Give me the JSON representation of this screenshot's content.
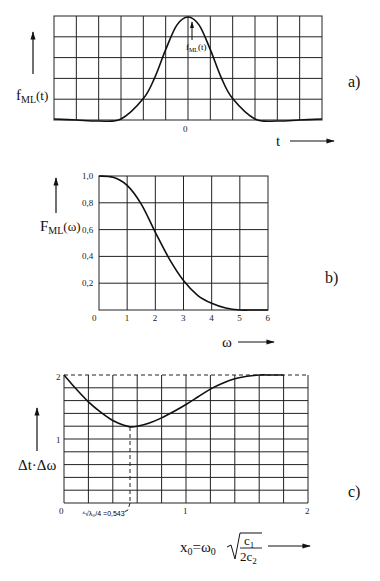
{
  "chart_data": [
    {
      "panel": "a)",
      "type": "line",
      "title": "",
      "ylabel": "f_ML(t)",
      "xlabel": "t",
      "annotation": "f_ML(t)",
      "x_tick_labels": [
        "0"
      ],
      "grid": {
        "columns": 12,
        "rows": 5
      },
      "x": [
        -6,
        -5,
        -4,
        -3,
        -2,
        -1.5,
        -1,
        -0.5,
        0,
        0.5,
        1,
        1.5,
        2,
        3,
        4,
        5,
        6
      ],
      "values": [
        0.0,
        -0.01,
        -0.02,
        0.0,
        0.2,
        0.4,
        0.68,
        0.92,
        1.0,
        0.92,
        0.68,
        0.4,
        0.2,
        0.0,
        -0.02,
        -0.01,
        0.0
      ],
      "ylim": [
        0,
        1
      ],
      "xlim": [
        -6,
        6
      ]
    },
    {
      "panel": "b)",
      "type": "line",
      "title": "",
      "ylabel": "F_ML(ω)",
      "xlabel": "ω",
      "x_tick_labels": [
        "0",
        "1",
        "2",
        "3",
        "4",
        "5",
        "6"
      ],
      "y_tick_labels": [
        "0,2",
        "0,4",
        "0,6",
        "0,8",
        "1,0"
      ],
      "x": [
        0,
        0.5,
        1,
        1.5,
        2,
        2.5,
        3,
        3.5,
        4,
        4.5,
        5,
        5.5,
        6
      ],
      "values": [
        1.0,
        0.99,
        0.93,
        0.79,
        0.58,
        0.38,
        0.22,
        0.11,
        0.05,
        0.015,
        0.0,
        0.0,
        0.0
      ],
      "xlim": [
        0,
        6
      ],
      "ylim": [
        0,
        1.0
      ],
      "grid": {
        "columns": 6,
        "rows": 5
      }
    },
    {
      "panel": "c)",
      "type": "line",
      "title": "",
      "ylabel": "Δt·Δω",
      "xlabel": "x₀ = ω₀ √(c₁ / 2c₂)",
      "x_tick_labels": [
        "0",
        "1",
        "2"
      ],
      "y_tick_labels": [
        "1",
        "2"
      ],
      "annotation": "⁴√(λ₀/4) = 0,543",
      "min_point": {
        "x": 0.543,
        "y": 1.19
      },
      "asymptote": 2,
      "x": [
        0,
        0.1,
        0.2,
        0.3,
        0.4,
        0.5,
        0.543,
        0.6,
        0.7,
        0.8,
        0.9,
        1.0,
        1.1,
        1.2,
        1.3,
        1.4,
        1.5,
        1.6,
        1.7,
        1.8
      ],
      "values": [
        2.0,
        1.78,
        1.58,
        1.42,
        1.29,
        1.21,
        1.19,
        1.2,
        1.25,
        1.33,
        1.43,
        1.54,
        1.66,
        1.78,
        1.87,
        1.94,
        1.98,
        2.0,
        2.0,
        2.0
      ],
      "xlim": [
        0,
        2
      ],
      "ylim": [
        0,
        2
      ],
      "grid": {
        "columns": 10,
        "rows": 10
      }
    }
  ],
  "labels": {
    "a": {
      "panel": "a)",
      "ylabel_main": "f",
      "ylabel_sub": "ML",
      "ylabel_tail": "(t)",
      "annot_main": "f",
      "annot_sub": "ML",
      "annot_tail": "(t)",
      "xtick0": "0",
      "xlabel": "t"
    },
    "b": {
      "panel": "b)",
      "ylabel_main": "F",
      "ylabel_sub": "ML",
      "ylabel_tail": "(ω)",
      "xlabel": "ω",
      "xticks": [
        "0",
        "1",
        "2",
        "3",
        "4",
        "5",
        "6"
      ],
      "yticks": [
        "1,0",
        "0,8",
        "0,6",
        "0,4",
        "0,2"
      ]
    },
    "c": {
      "panel": "c)",
      "ylabel": "Δt·Δω",
      "ytick2": "2",
      "ytick1": "1",
      "xticks": [
        "0",
        "1",
        "2"
      ],
      "annotation": "⁴√λ₀/4 =0,543",
      "xlabel_lhs": "x",
      "xlabel_lhs_sub": "0",
      "xlabel_eq": "=",
      "xlabel_omega": "ω",
      "xlabel_omega_sub": "0",
      "xlabel_num": "c",
      "xlabel_num_sub": "1",
      "xlabel_den": "2c",
      "xlabel_den_sub": "2"
    }
  }
}
